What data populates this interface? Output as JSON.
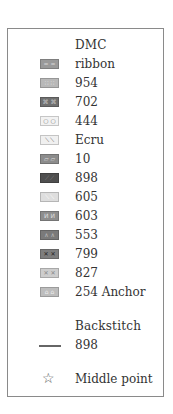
{
  "legend": {
    "dmc_header": "DMC",
    "items": [
      {
        "label": "ribbon",
        "symbol": "= =",
        "bg": "#9a9a9a",
        "fg": "#d8d8d8",
        "icon": "double-dash-icon"
      },
      {
        "label": "954",
        "symbol": "∷ ∷",
        "bg": "#b8b8b8",
        "fg": "#eeeeee",
        "icon": "dots-grid-icon"
      },
      {
        "label": "702",
        "symbol": "⌘ ⌘",
        "bg": "#707070",
        "fg": "#cccccc",
        "icon": "cross-knot-icon"
      },
      {
        "label": "444",
        "symbol": "○ ○",
        "bg": "#f2f2f2",
        "fg": "#777777",
        "icon": "circle-icon"
      },
      {
        "label": "Ecru",
        "symbol": "⟍ ⟍",
        "bg": "#f0f0f0",
        "fg": "#555555",
        "icon": "backslash-icon"
      },
      {
        "label": "10",
        "symbol": "▱ ▱",
        "bg": "#8c8c8c",
        "fg": "#dddddd",
        "icon": "parallelogram-icon"
      },
      {
        "label": "898",
        "symbol": "⟋ ⟋",
        "bg": "#4f4f4f",
        "fg": "#888888",
        "icon": "slash-icon"
      },
      {
        "label": "605",
        "symbol": "⟍ ⟍",
        "bg": "#dedede",
        "fg": "#ffffff",
        "icon": "diagonal-light-icon"
      },
      {
        "label": "603",
        "symbol": "И И",
        "bg": "#8e8e8e",
        "fg": "#e0e0e0",
        "icon": "reverse-n-icon"
      },
      {
        "label": "553",
        "symbol": "∧ ∧",
        "bg": "#7a7a7a",
        "fg": "#bbbbbb",
        "icon": "chevron-up-icon"
      },
      {
        "label": "799",
        "symbol": "✕ ✕",
        "bg": "#7e7e7e",
        "fg": "#222222",
        "icon": "x-mark-icon"
      },
      {
        "label": "827",
        "symbol": "✕ ✕",
        "bg": "#cdcdcd",
        "fg": "#888888",
        "icon": "x-light-icon"
      },
      {
        "label": "254 Anchor",
        "symbol": "⌂ ⌂",
        "bg": "#bdbdbd",
        "fg": "#eeeeee",
        "icon": "house-icon"
      }
    ],
    "backstitch_header": "Backstitch",
    "backstitch_item": {
      "label": "898",
      "color": "#666666"
    },
    "middle_point": {
      "label": "Middle point",
      "symbol": "☆"
    }
  }
}
